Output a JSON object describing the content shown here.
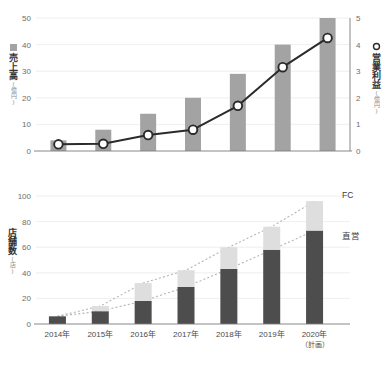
{
  "chart_data": [
    {
      "type": "bar",
      "id": "sales-profit-chart",
      "title": "",
      "categories": [
        "2014年",
        "2015年",
        "2016年",
        "2017年",
        "2018年",
        "2019年",
        "2020年"
      ],
      "xlabel": "",
      "ylabel": "売上高",
      "ylabel_unit": "(億円)",
      "ylim": [
        0,
        50
      ],
      "yticks": [
        0,
        10,
        20,
        30,
        40,
        50
      ],
      "y2label": "営業利益",
      "y2label_unit": "(億円)",
      "y2lim": [
        0,
        5
      ],
      "y2ticks": [
        0,
        1,
        2,
        3,
        4,
        5
      ],
      "grid": true,
      "legend_position": "axis-titles",
      "series": [
        {
          "name": "売上高",
          "type": "bar",
          "axis": "left",
          "unit": "億円",
          "color": "#a3a3a3",
          "marker": "bar",
          "values": [
            4,
            8,
            14,
            20,
            29,
            40,
            50
          ]
        },
        {
          "name": "営業利益",
          "type": "line",
          "axis": "right",
          "unit": "億円",
          "color": "#2b2b2b",
          "marker": "circle-open",
          "marker_fill": "#ffffff",
          "values": [
            0.25,
            0.27,
            0.6,
            0.8,
            1.7,
            3.15,
            4.25
          ]
        }
      ]
    },
    {
      "type": "bar",
      "id": "store-count-chart",
      "title": "",
      "categories": [
        "2014年",
        "2015年",
        "2016年",
        "2017年",
        "2018年",
        "2019年",
        "2020年"
      ],
      "category_sublabels": [
        "",
        "",
        "",
        "",
        "",
        "",
        "（計画）"
      ],
      "xlabel": "",
      "ylabel": "店舗数",
      "ylabel_unit": "(店)",
      "ylim": [
        0,
        100
      ],
      "yticks": [
        0,
        20,
        40,
        60,
        80,
        100
      ],
      "grid": true,
      "stacked": true,
      "legend_position": "right-inline",
      "series": [
        {
          "name": "直営",
          "type": "bar",
          "color": "#4d4d4d",
          "values": [
            6,
            10,
            18,
            29,
            43,
            58,
            73
          ]
        },
        {
          "name": "FC",
          "type": "bar",
          "color": "#dedede",
          "values": [
            0,
            4,
            14,
            13,
            17,
            18,
            23
          ]
        }
      ],
      "totals": [
        6,
        14,
        32,
        42,
        60,
        76,
        96
      ],
      "trendlines": [
        {
          "name": "total-trend",
          "style": "dotted",
          "color": "#b5b5b5",
          "values": [
            6,
            14,
            32,
            42,
            60,
            76,
            96
          ]
        },
        {
          "name": "direct-trend",
          "style": "dotted",
          "color": "#b5b5b5",
          "values": [
            6,
            10,
            18,
            29,
            43,
            58,
            73
          ]
        }
      ]
    }
  ],
  "top_chart": {
    "left_axis_title": "売上高",
    "left_axis_unit": "(億円)",
    "right_axis_title": "営業利益",
    "right_axis_unit": "(億円)",
    "left_ticks": [
      "50",
      "40",
      "30",
      "20",
      "10",
      "0"
    ],
    "right_ticks": [
      "5",
      "4",
      "3",
      "2",
      "1",
      "0"
    ],
    "bar_legend_icon": "bar-swatch-icon",
    "line_legend_icon": "circle-open-icon"
  },
  "bottom_chart": {
    "axis_title": "店舗数",
    "axis_unit": "(店)",
    "ticks": [
      "100",
      "80",
      "60",
      "40",
      "20",
      "0"
    ],
    "categories": [
      "2014年",
      "2015年",
      "2016年",
      "2017年",
      "2018年",
      "2019年",
      "2020年"
    ],
    "last_category_sub": "（計画）",
    "legend_fc": "FC",
    "legend_direct": "直営"
  },
  "colors": {
    "sales_bar": "#a3a3a3",
    "profit_line": "#2b2b2b",
    "direct_bar": "#4d4d4d",
    "fc_bar": "#dedede",
    "grid": "#eceaea",
    "axis": "#7a7a7a",
    "tick_text": "#6d6d6d",
    "trend_dotted": "#b5b5b5"
  }
}
